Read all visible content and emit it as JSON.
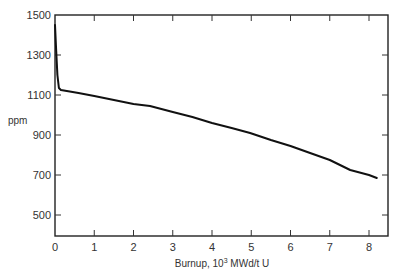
{
  "chart_data": {
    "type": "line",
    "title": "",
    "xlabel": "Burnup, 10³ MWd/t U",
    "xlabel_parts": {
      "prefix": "Burnup, 10",
      "sup": "3",
      "suffix": " MWd/t U"
    },
    "ylabel": "ppm",
    "xlim": [
      0,
      8.5
    ],
    "ylim": [
      400,
      1500
    ],
    "x_ticks": [
      0,
      1,
      2,
      3,
      4,
      5,
      6,
      7,
      8
    ],
    "y_ticks": [
      500,
      700,
      900,
      1100,
      1300,
      1500
    ],
    "grid": false,
    "legend": null,
    "series": [
      {
        "name": "boron concentration",
        "x": [
          0.0,
          0.03,
          0.06,
          0.1,
          0.15,
          0.3,
          0.6,
          1.0,
          1.5,
          2.0,
          2.42,
          3.0,
          3.5,
          4.0,
          4.5,
          4.97,
          5.5,
          6.0,
          6.5,
          7.0,
          7.52,
          8.0,
          8.2
        ],
        "values": [
          1450,
          1320,
          1200,
          1135,
          1125,
          1120,
          1110,
          1095,
          1075,
          1055,
          1045,
          1015,
          990,
          960,
          935,
          910,
          875,
          845,
          810,
          775,
          725,
          700,
          685
        ]
      }
    ]
  }
}
